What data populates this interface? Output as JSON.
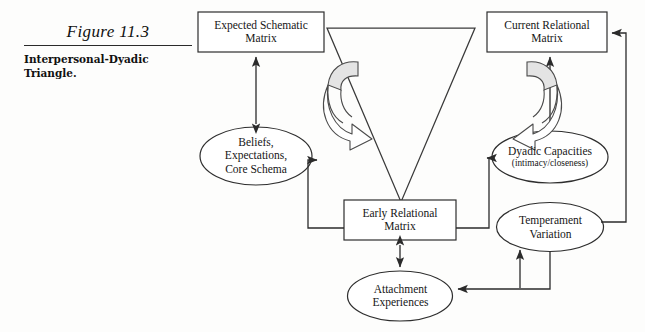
{
  "figure": {
    "number": "Figure 11.3",
    "caption_line1": "Interpersonal-Dyadic",
    "caption_line2": "Triangle."
  },
  "diagram": {
    "type": "flow-diagram",
    "background_color": "#fdfdfc",
    "stroke_color": "#333333",
    "swirl_fill": "#e8e8e8",
    "nodes": [
      {
        "id": "expected-schematic-matrix",
        "shape": "rectangle",
        "lines": [
          "Expected Schematic",
          "Matrix"
        ],
        "x": 198,
        "y": 12,
        "w": 126,
        "h": 40
      },
      {
        "id": "current-relational-matrix",
        "shape": "rectangle",
        "lines": [
          "Current Relational",
          "Matrix"
        ],
        "x": 487,
        "y": 12,
        "w": 120,
        "h": 40
      },
      {
        "id": "beliefs-expectations-core-schema",
        "shape": "ellipse",
        "lines": [
          "Beliefs,",
          "Expectations,",
          "Core Schema"
        ],
        "x": 200,
        "y": 127,
        "w": 112,
        "h": 58
      },
      {
        "id": "dyadic-capacities",
        "shape": "ellipse",
        "lines": [
          "Dyadic Capacities"
        ],
        "sublines": [
          "(intimacy/closeness)"
        ],
        "x": 492,
        "y": 131,
        "w": 116,
        "h": 52
      },
      {
        "id": "early-relational-matrix",
        "shape": "rectangle",
        "lines": [
          "Early Relational",
          "Matrix"
        ],
        "x": 344,
        "y": 200,
        "w": 112,
        "h": 40
      },
      {
        "id": "temperament-variation",
        "shape": "ellipse",
        "lines": [
          "Temperament",
          "Variation"
        ],
        "x": 497,
        "y": 203,
        "w": 107,
        "h": 49
      },
      {
        "id": "attachment-experiences",
        "shape": "ellipse",
        "lines": [
          "Attachment",
          "Experiences"
        ],
        "x": 348,
        "y": 271,
        "w": 105,
        "h": 50
      }
    ],
    "triangle": {
      "id": "inverted-triangle",
      "points": "327,28 475,28 401,202"
    },
    "edges": [
      {
        "id": "beliefs-to-expected",
        "from": "beliefs-expectations-core-schema",
        "to": "expected-schematic-matrix",
        "arrows": "double"
      },
      {
        "id": "dyadic-to-current",
        "from": "dyadic-capacities",
        "to": "current-relational-matrix",
        "arrows": "single"
      },
      {
        "id": "early-to-beliefs",
        "from": "early-relational-matrix",
        "to": "beliefs-expectations-core-schema",
        "arrows": "single"
      },
      {
        "id": "early-to-dyadic",
        "from": "early-relational-matrix",
        "to": "dyadic-capacities",
        "arrows": "single"
      },
      {
        "id": "early-to-attachment",
        "from": "early-relational-matrix",
        "to": "attachment-experiences",
        "arrows": "double"
      },
      {
        "id": "attachment-to-temperament",
        "from": "attachment-experiences",
        "to": "temperament-variation",
        "arrows": "single"
      },
      {
        "id": "temperament-to-current",
        "from": "temperament-variation",
        "to": "current-relational-matrix",
        "arrows": "single"
      },
      {
        "id": "temperament-to-attachment",
        "from": "temperament-variation",
        "to": "attachment-experiences",
        "arrows": "single"
      }
    ],
    "swirls": [
      {
        "id": "swirl-left",
        "direction": "clockwise-right",
        "x": 322,
        "y": 62
      },
      {
        "id": "swirl-right",
        "direction": "counterclockwise-left",
        "x": 440,
        "y": 62
      }
    ]
  }
}
